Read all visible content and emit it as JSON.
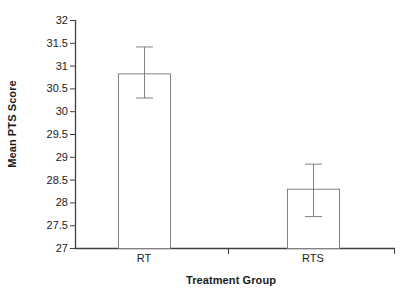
{
  "chart_data": {
    "type": "bar",
    "title": "",
    "xlabel": "Treatment Group",
    "ylabel": "Mean PTS Score",
    "categories": [
      "RT",
      "RTS"
    ],
    "values": [
      30.83,
      28.3
    ],
    "error_low": [
      30.3,
      27.7
    ],
    "error_high": [
      31.42,
      28.85
    ],
    "errorbars": [
      {
        "category": "RT",
        "value": 30.83,
        "low": 30.3,
        "high": 31.42
      },
      {
        "category": "RTS",
        "value": 28.3,
        "low": 27.7,
        "high": 28.85
      }
    ],
    "ylim": [
      27,
      32
    ],
    "ytick_step": 0.5,
    "ytick_labels": [
      "32",
      "31.5",
      "31",
      "30.5",
      "30",
      "29.5",
      "29",
      "28.5",
      "28",
      "27.5",
      "27"
    ],
    "ytick_values": [
      32,
      31.5,
      31,
      30.5,
      30,
      29.5,
      29,
      28.5,
      28,
      27.5,
      27
    ],
    "grid": false,
    "legend": false,
    "legend_position": "none",
    "bar_fill_color": "#ffffff",
    "bar_edge_color": "#808080",
    "axis_color": "#404040",
    "errorbar_color": "#808080"
  }
}
